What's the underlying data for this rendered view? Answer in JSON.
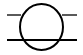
{
  "diagram": {
    "symbol": "circle-with-two-horizontal-lines",
    "stroke_color": "#000000",
    "background": "#ffffff",
    "circle": {
      "cx": 41.5,
      "cy": 27,
      "rx": 21.5,
      "ry": 23
    },
    "top_line": {
      "y": 15,
      "left": [
        7,
        21
      ],
      "right": [
        62,
        77
      ],
      "width": 1.3
    },
    "bottom_line": {
      "y": 40,
      "x1": 7,
      "x2": 77,
      "width": 2.2
    }
  }
}
